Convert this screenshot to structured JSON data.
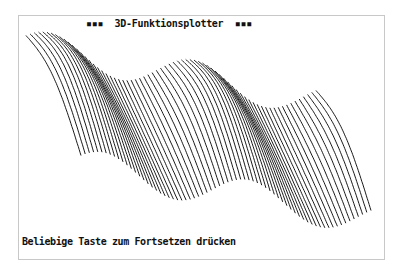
{
  "screen": {
    "title": "▪▪▪  3D-Funktionsplotter  ▪▪▪",
    "title_text": "3D-Funktionsplotter",
    "prompt": "Beliebige Taste zum Fortsetzen drücken"
  },
  "plot": {
    "type": "3d-surface-wireframe",
    "line_color": "#000000",
    "background": "#ffffff",
    "line_count": 70,
    "wave_periods": 2,
    "description": "Sine-wave ridged surface plotted diagonally from upper-left to lower-right"
  }
}
